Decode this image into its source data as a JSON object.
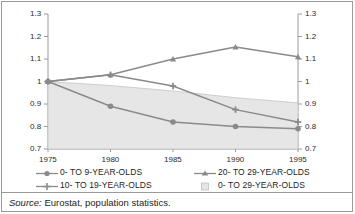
{
  "chart_data": {
    "type": "line",
    "title": "",
    "subtitle": "",
    "xlabel": "",
    "ylabel": "",
    "x": [
      1975,
      1980,
      1985,
      1990,
      1995
    ],
    "xtick_labels": [
      "1975",
      "1980",
      "1985",
      "1990",
      "1995"
    ],
    "ylim": [
      0.7,
      1.3
    ],
    "ytick_values": [
      1.3,
      1.2,
      1.1,
      1.0,
      0.9,
      0.8,
      0.7
    ],
    "ytick_labels_left": [
      "1.3",
      "1.2",
      "1.1",
      "1",
      "0.9",
      "0.8",
      "0.7"
    ],
    "ytick_labels_right": [
      "1.3",
      "1.2",
      "1.1",
      "1",
      "0.9",
      "0.8",
      "0.7"
    ],
    "dual_axis": true,
    "grid": false,
    "legend_position": "bottom",
    "series": [
      {
        "name": "0- TO 9-YEAR-OLDS",
        "marker": "circle",
        "color": "#8a8a8a",
        "values": [
          1.0,
          0.89,
          0.82,
          0.8,
          0.79
        ]
      },
      {
        "name": "10- TO 19-YEAR-OLDS",
        "marker": "cross",
        "color": "#8a8a8a",
        "values": [
          1.0,
          1.03,
          0.98,
          0.875,
          0.82
        ]
      },
      {
        "name": "20- TO 29-YEAR-OLDS",
        "marker": "triangle",
        "color": "#8a8a8a",
        "values": [
          1.0,
          1.03,
          1.1,
          1.153,
          1.11
        ]
      },
      {
        "name": "0- TO 29-YEAR-OLDS",
        "marker": "area-swatch",
        "type": "area",
        "color": "#e6e6e6",
        "values": [
          1.0,
          0.982,
          0.958,
          0.928,
          0.905
        ]
      }
    ]
  },
  "legend": {
    "left_column": [
      {
        "label": "0- TO 9-YEAR-OLDS",
        "marker": "circle"
      },
      {
        "label": "10- TO 19-YEAR-OLDS",
        "marker": "cross"
      }
    ],
    "right_column": [
      {
        "label": "20- TO 29-YEAR-OLDS",
        "marker": "triangle"
      },
      {
        "label": "0- TO 29-YEAR-OLDS",
        "marker": "area-swatch"
      }
    ]
  },
  "source": {
    "keyword": "Source:",
    "text": "Eurostat, population statistics."
  },
  "colors": {
    "line": "#8a8a8a",
    "area_fill": "#e6e6e6",
    "area_edge": "#c4c4c4",
    "axis": "#9a9a9a",
    "text": "#1d1d1d"
  }
}
